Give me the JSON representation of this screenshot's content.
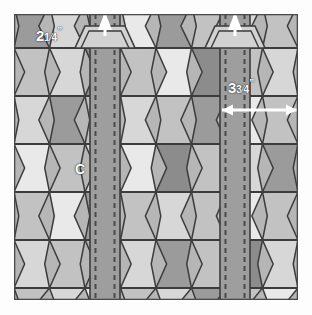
{
  "figure": {
    "kind": "quilt-assembly-diagram",
    "background_color": "#fdfdfd",
    "panel_color": "#b6b6b6",
    "outline_color": "#3c3c3c"
  },
  "labels": {
    "left_measure": {
      "whole": "2",
      "num": "1",
      "den": "4",
      "unit": "”",
      "full_text": "2¼”",
      "name": "sash-width-label"
    },
    "right_measure": {
      "whole": "3",
      "num": "3",
      "den": "4",
      "unit": "”",
      "full_text": "3¾”",
      "name": "block-width-label"
    },
    "piece_marker": {
      "text": "C",
      "name": "piece-c-label"
    }
  },
  "sashes": [
    {
      "name": "left-sash",
      "x": 76,
      "width": 30,
      "stitch_color": "#4a4a4a",
      "fill": "#9e9e9e"
    },
    {
      "name": "right-sash",
      "x": 206,
      "width": 30,
      "stitch_color": "#4a4a4a",
      "fill": "#9e9e9e"
    }
  ],
  "brackets": [
    {
      "name": "left-bracket",
      "cx": 91
    },
    {
      "name": "right-bracket",
      "cx": 221
    }
  ],
  "arrow": {
    "name": "width-dimension-arrow",
    "color": "#ffffff",
    "x1": 208,
    "x2": 283,
    "y": 96
  },
  "palette": {
    "light": "#e9e9e9",
    "pale": "#d7d7d7",
    "mid": "#c2c2c2",
    "midgray": "#b0b0b0",
    "dark": "#9b9b9b",
    "darker": "#8c8c8c"
  },
  "chart_data": {
    "type": "table",
    "rows": [
      {
        "y0": -10,
        "y1": 34,
        "cells": [
          "dark",
          "pale",
          "mid",
          "light",
          "dark",
          "mid",
          "pale",
          "mid"
        ]
      },
      {
        "y0": 34,
        "y1": 82,
        "cells": [
          "mid",
          "pale",
          "darker",
          "mid",
          "light",
          "darker",
          "mid",
          "pale"
        ]
      },
      {
        "y0": 82,
        "y1": 130,
        "cells": [
          "pale",
          "dark",
          "mid",
          "pale",
          "mid",
          "dark",
          "light",
          "mid"
        ]
      },
      {
        "y0": 130,
        "y1": 178,
        "cells": [
          "light",
          "mid",
          "pale",
          "light",
          "darker",
          "mid",
          "pale",
          "dark"
        ]
      },
      {
        "y0": 178,
        "y1": 226,
        "cells": [
          "mid",
          "light",
          "dark",
          "mid",
          "pale",
          "mid",
          "light",
          "mid"
        ]
      },
      {
        "y0": 226,
        "y1": 274,
        "cells": [
          "pale",
          "mid",
          "midgray",
          "pale",
          "dark",
          "mid",
          "darker",
          "pale"
        ]
      },
      {
        "y0": 274,
        "y1": 300,
        "cells": [
          "mid",
          "pale",
          "light",
          "mid",
          "pale",
          "dark",
          "mid",
          "light"
        ]
      }
    ]
  }
}
